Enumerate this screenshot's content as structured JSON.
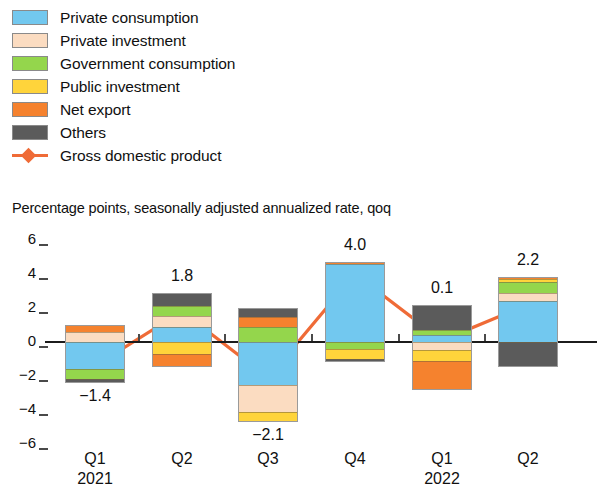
{
  "subtitle": "Percentage points, seasonally adjusted annualized rate, qoq",
  "legend": {
    "items": [
      {
        "label": "Private consumption",
        "color": "#72C8EF",
        "marker": "swatch",
        "key": "private_consumption"
      },
      {
        "label": "Private investment",
        "color": "#FBDCC1",
        "marker": "swatch",
        "key": "private_investment"
      },
      {
        "label": "Government consumption",
        "color": "#94D64C",
        "marker": "swatch",
        "key": "government_consumption"
      },
      {
        "label": "Public investment",
        "color": "#FFD43B",
        "marker": "swatch",
        "key": "public_investment"
      },
      {
        "label": "Net export",
        "color": "#F5822E",
        "marker": "swatch",
        "key": "net_export"
      },
      {
        "label": "Others",
        "color": "#5B5B5B",
        "marker": "swatch",
        "key": "others"
      },
      {
        "label": "Gross domestic product",
        "color": "#EF6B37",
        "marker": "line-diamond",
        "key": "gdp"
      }
    ]
  },
  "chart_data": {
    "type": "bar",
    "stacked": true,
    "title": "",
    "subtitle": "Percentage points, seasonally adjusted annualized rate, qoq",
    "xlabel": "",
    "ylabel": "Percentage points, seasonally adjusted annualized rate, qoq",
    "ylim": [
      -6,
      6
    ],
    "yticks": [
      6,
      4,
      2,
      0,
      -2,
      -4,
      -6
    ],
    "ytick_labels": [
      "6",
      "4",
      "2",
      "0",
      "−2",
      "−4",
      "−6"
    ],
    "grid": false,
    "legend_position": "top-left",
    "categories": [
      "Q1",
      "Q2",
      "Q3",
      "Q4",
      "Q1",
      "Q2"
    ],
    "category_years": [
      "2021",
      "",
      "",
      "",
      "2022",
      ""
    ],
    "series": [
      {
        "name": "Private consumption",
        "color": "#72C8EF",
        "values": [
          -1.6,
          0.9,
          -2.5,
          4.6,
          0.4,
          2.4
        ]
      },
      {
        "name": "Private investment",
        "color": "#FBDCC1",
        "values": [
          0.6,
          0.6,
          -1.6,
          0.0,
          -0.5,
          0.5
        ]
      },
      {
        "name": "Government consumption",
        "color": "#94D64C",
        "values": [
          -0.6,
          0.6,
          0.9,
          -0.4,
          0.3,
          0.6
        ]
      },
      {
        "name": "Public investment",
        "color": "#FFD43B",
        "values": [
          0.0,
          -0.7,
          -0.6,
          -0.6,
          -0.6,
          0.2
        ]
      },
      {
        "name": "Net export",
        "color": "#F5822E",
        "values": [
          0.4,
          -0.8,
          0.6,
          0.1,
          -1.7,
          0.1
        ]
      },
      {
        "name": "Others",
        "color": "#5B5B5B",
        "values": [
          -0.2,
          0.8,
          0.5,
          -0.2,
          1.5,
          -1.5
        ]
      }
    ],
    "gdp_line": {
      "name": "Gross domestic product",
      "color": "#EF6B37",
      "values": [
        -1.4,
        1.8,
        -2.1,
        4.0,
        0.1,
        2.2
      ],
      "labels": [
        "−1.4",
        "1.8",
        "−2.1",
        "4.0",
        "0.1",
        "2.2"
      ]
    }
  }
}
